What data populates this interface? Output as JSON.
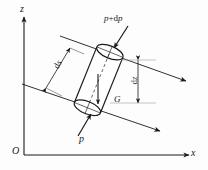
{
  "figure": {
    "type": "technical-diagram",
    "background_color": "#fdfdfd",
    "line_color": "#1a1a1a"
  },
  "axes": {
    "vertical_label": "z",
    "horizontal_label": "x",
    "origin_label": "O"
  },
  "labels": {
    "pressure_top": "p+dp",
    "pressure_top_symbol": "p",
    "pressure_top_operator": "+",
    "pressure_top_delta": "d",
    "pressure_top_var": "p",
    "pressure_bottom": "p",
    "weight": "G",
    "length_delta": "d",
    "length_var": "s",
    "length_dimension": "ds",
    "height_delta": "d",
    "height_var": "z",
    "height_dimension": "dz"
  },
  "elements": {
    "cylinder": "tilted cylinder with elliptical end caps",
    "streamlines": 2,
    "arrow_count": 8
  }
}
